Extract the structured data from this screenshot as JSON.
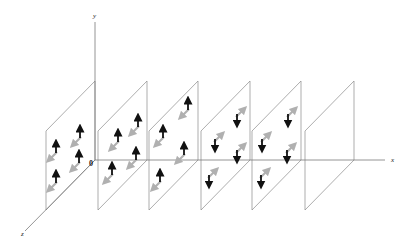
{
  "figure": {
    "axes": {
      "x": {
        "label": "x",
        "line": [
          95,
          160,
          385,
          160
        ],
        "label_pos": [
          391,
          162
        ]
      },
      "y": {
        "label": "y",
        "line": [
          95,
          160,
          95,
          22
        ],
        "label_pos": [
          93,
          18
        ]
      },
      "z": {
        "label": "z",
        "line": [
          95,
          160,
          25,
          231
        ],
        "label_pos": [
          21,
          236
        ]
      },
      "origin": {
        "label": "0",
        "pos": [
          89,
          166
        ]
      }
    },
    "colors": {
      "axis": "#7a7a7a",
      "plane_edge": "#8a8a8a",
      "plane_edge_light": "#b5b5b5",
      "spin_vertical": "#111111",
      "spin_diagonal": "#b0b0b0"
    },
    "plane_geometry": {
      "top_y": 81,
      "bottom_y": 160,
      "depth_dx": 49,
      "depth_dy": 50
    },
    "planes": [
      {
        "right_x": 95,
        "spin": "up",
        "arrows": [
          [
            56,
            148
          ],
          [
            80,
            133
          ],
          [
            79,
            158
          ],
          [
            56,
            178
          ]
        ]
      },
      {
        "right_x": 147,
        "spin": "up",
        "arrows": [
          [
            118,
            137
          ],
          [
            138,
            122
          ],
          [
            136,
            155
          ],
          [
            112,
            170
          ]
        ]
      },
      {
        "right_x": 198,
        "spin": "up",
        "arrows": [
          [
            188,
            105
          ],
          [
            163,
            133
          ],
          [
            184,
            150
          ],
          [
            160,
            177
          ]
        ]
      },
      {
        "right_x": 250,
        "spin": "down",
        "arrows": [
          [
            237,
            119
          ],
          [
            215,
            144
          ],
          [
            237,
            155
          ],
          [
            209,
            180
          ]
        ]
      },
      {
        "right_x": 301,
        "spin": "down",
        "arrows": [
          [
            288,
            119
          ],
          [
            262,
            144
          ],
          [
            287,
            155
          ],
          [
            261,
            180
          ]
        ]
      },
      {
        "right_x": 354,
        "spin": "none",
        "arrows": []
      }
    ]
  }
}
